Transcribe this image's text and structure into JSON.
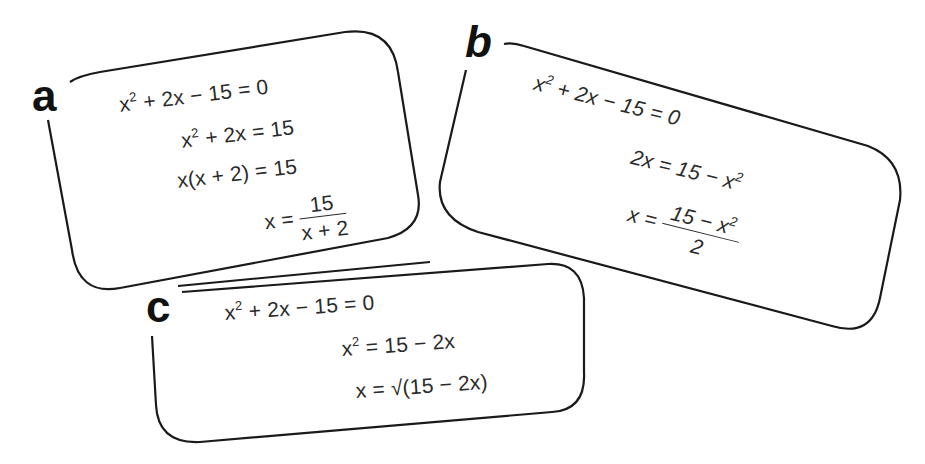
{
  "cards": [
    {
      "label": "a",
      "lines": [
        {
          "base": "x",
          "sup": "2",
          "rest": " + 2x − 15 = 0"
        },
        {
          "base": "x",
          "sup": "2",
          "rest": " + 2x = 15"
        },
        {
          "text": "x(x + 2) = 15"
        },
        {
          "lhs": "x = ",
          "numerator": "15",
          "denominator": "x + 2"
        }
      ]
    },
    {
      "label": "b",
      "lines": [
        {
          "base": "x",
          "sup": "2",
          "rest": " + 2x − 15 = 0"
        },
        {
          "lhs": "2x = 15 − x",
          "sup": "2"
        },
        {
          "lhs": "x = ",
          "numerator_base": "15 − x",
          "numerator_sup": "2",
          "denominator": "2"
        }
      ]
    },
    {
      "label": "c",
      "lines": [
        {
          "base": "x",
          "sup": "2",
          "rest": " + 2x − 15 = 0"
        },
        {
          "base": "x",
          "sup": "2",
          "rest": " = 15 − 2x"
        },
        {
          "text": "x = √(15 − 2x)"
        }
      ]
    }
  ]
}
